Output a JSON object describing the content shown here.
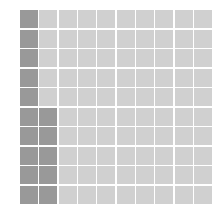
{
  "chart_data": {
    "type": "waffle",
    "rows": 10,
    "cols": 10,
    "total": 100,
    "filled": 15,
    "fill_order": "column-wise, bottom-to-top, left-to-right",
    "filled_cells": [
      {
        "col": 0,
        "rows": [
          0,
          1,
          2,
          3,
          4,
          5,
          6,
          7,
          8,
          9
        ]
      },
      {
        "col": 1,
        "rows": [
          5,
          6,
          7,
          8,
          9
        ]
      }
    ],
    "colors": {
      "filled": "#999999",
      "empty": "#d0d0d0",
      "gap": "#ffffff"
    },
    "title": "",
    "legend": []
  }
}
